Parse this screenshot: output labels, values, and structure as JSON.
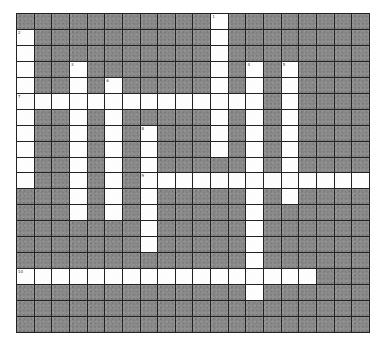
{
  "puzzle": {
    "rows": 20,
    "cols": 20,
    "colors": {
      "block": "#8a8a8a",
      "open": "#fdfdfd",
      "grid_line": "#222222"
    },
    "entries": [
      {
        "number": 1,
        "direction": "down",
        "row": 0,
        "col": 11,
        "length": 9
      },
      {
        "number": 2,
        "direction": "down",
        "row": 1,
        "col": 0,
        "length": 10
      },
      {
        "number": 3,
        "direction": "down",
        "row": 3,
        "col": 3,
        "length": 10
      },
      {
        "number": 4,
        "direction": "down",
        "row": 3,
        "col": 13,
        "length": 15
      },
      {
        "number": 5,
        "direction": "down",
        "row": 3,
        "col": 15,
        "length": 9
      },
      {
        "number": 6,
        "direction": "down",
        "row": 4,
        "col": 5,
        "length": 9
      },
      {
        "number": 7,
        "direction": "across",
        "row": 5,
        "col": 0,
        "length": 14
      },
      {
        "number": 8,
        "direction": "down",
        "row": 7,
        "col": 7,
        "length": 8
      },
      {
        "number": 9,
        "direction": "across",
        "row": 10,
        "col": 7,
        "length": 13
      },
      {
        "number": 10,
        "direction": "across",
        "row": 16,
        "col": 0,
        "length": 17
      }
    ]
  }
}
